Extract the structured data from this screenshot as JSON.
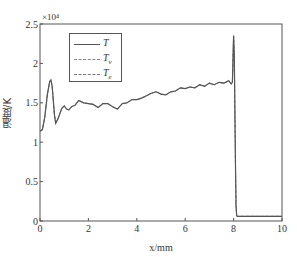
{
  "chart_data": {
    "type": "line",
    "title": "",
    "xlabel": "x/mm",
    "ylabel": "温度/K",
    "y_multiplier": "×10⁴",
    "xlim": [
      0,
      10
    ],
    "ylim": [
      0,
      25000
    ],
    "xticks": [
      0,
      2,
      4,
      6,
      8,
      10
    ],
    "yticks": [
      0,
      0.5,
      1,
      1.5,
      2,
      2.5
    ],
    "ytick_labels": [
      "0",
      "0.5",
      "1",
      "1.5",
      "2",
      "2.5"
    ],
    "grid": false,
    "legend_position": "upper-left",
    "series": [
      {
        "name": "T",
        "style": "solid",
        "color": "#555555",
        "x": [
          0,
          0.1,
          0.2,
          0.3,
          0.4,
          0.45,
          0.5,
          0.6,
          0.65,
          0.75,
          0.9,
          1.0,
          1.1,
          1.2,
          1.3,
          1.45,
          1.6,
          1.8,
          2.0,
          2.2,
          2.4,
          2.6,
          2.8,
          3.0,
          3.2,
          3.4,
          3.6,
          3.8,
          4.0,
          4.2,
          4.4,
          4.6,
          4.8,
          5.0,
          5.2,
          5.4,
          5.6,
          5.8,
          6.0,
          6.2,
          6.4,
          6.6,
          6.8,
          7.0,
          7.2,
          7.4,
          7.6,
          7.8,
          7.9,
          7.95,
          8.0,
          8.03,
          8.05,
          8.08,
          8.1,
          8.13,
          8.15,
          8.2,
          8.5,
          9.0,
          9.5,
          10.0
        ],
        "y": [
          11400,
          11600,
          13200,
          16000,
          17700,
          17900,
          17200,
          13400,
          12400,
          13000,
          14300,
          14600,
          14200,
          14100,
          14500,
          14700,
          15300,
          15000,
          14900,
          14800,
          14400,
          14900,
          14900,
          14500,
          14200,
          14900,
          15000,
          15400,
          15400,
          15600,
          15900,
          16200,
          16400,
          16100,
          16000,
          16400,
          16500,
          16900,
          16800,
          17000,
          16900,
          17300,
          17100,
          17500,
          17300,
          17600,
          17500,
          17800,
          17400,
          17600,
          23500,
          21000,
          15000,
          7000,
          2000,
          700,
          600,
          600,
          600,
          600,
          600,
          600
        ]
      },
      {
        "name": "T_v",
        "style": "dashdot",
        "color": "#777777"
      },
      {
        "name": "T_e",
        "style": "dashed",
        "color": "#777777"
      }
    ]
  },
  "legend": {
    "items": [
      {
        "main": "T",
        "sub": ""
      },
      {
        "main": "T",
        "sub": "v"
      },
      {
        "main": "T",
        "sub": "e"
      }
    ]
  }
}
